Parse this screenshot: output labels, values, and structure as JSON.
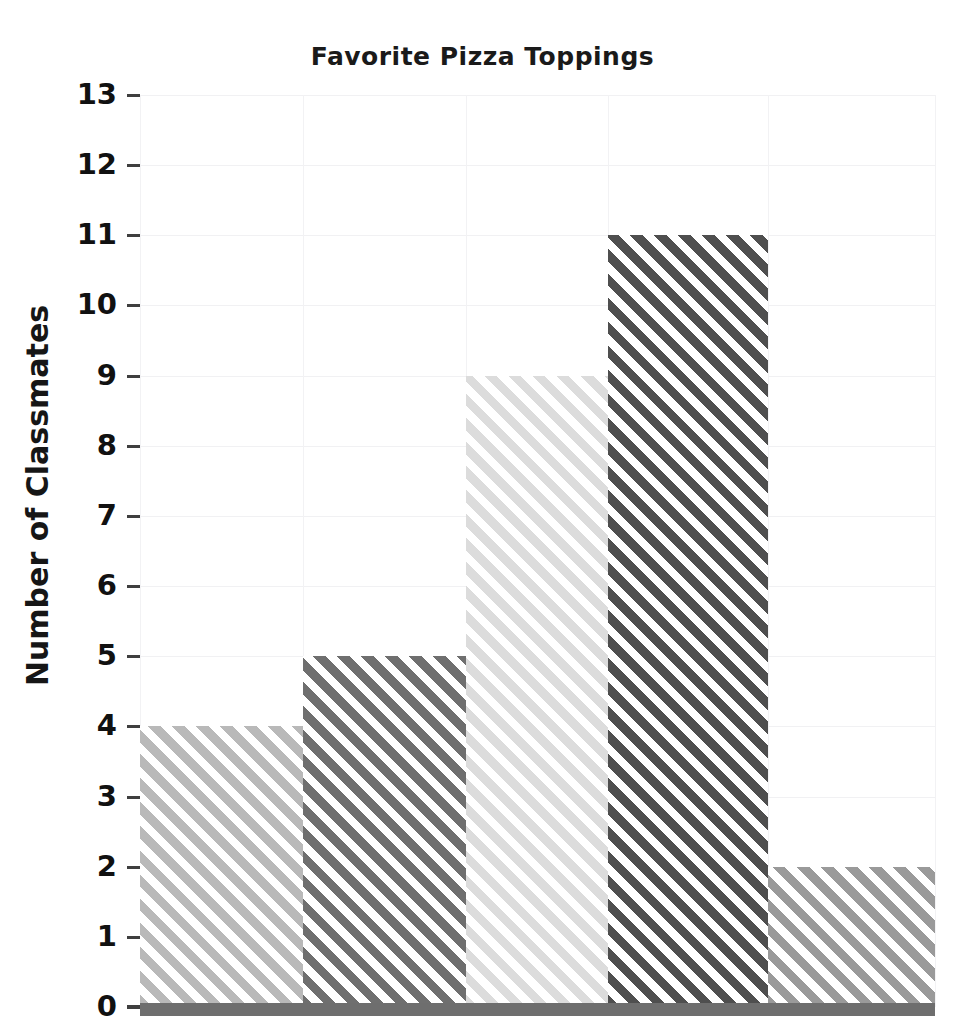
{
  "chart_data": {
    "type": "bar",
    "title": "Favorite Pizza Toppings",
    "xlabel": "",
    "ylabel": "Number of Classmates",
    "categories": [
      "bar-1",
      "bar-2",
      "bar-3",
      "bar-4",
      "bar-5"
    ],
    "values": [
      4,
      5,
      9,
      11,
      2
    ],
    "ylim": [
      0,
      13
    ],
    "yticks": [
      0,
      1,
      2,
      3,
      4,
      5,
      6,
      7,
      8,
      9,
      10,
      11,
      12,
      13
    ],
    "ytick_labels": [
      "0",
      "1",
      "2",
      "3",
      "4",
      "5",
      "6",
      "7",
      "8",
      "9",
      "10",
      "11",
      "12",
      "13"
    ],
    "grid": true,
    "legend": "none",
    "bar_colors": [
      "#b9b9b9",
      "#6f6f6f",
      "#dcdcdc",
      "#4f4f4f",
      "#9a9a9a"
    ],
    "bar_hatch": "diagonal-lines",
    "axis_color": "#6e6e6e",
    "grid_color": "#f1f1f3",
    "background": "#ffffff",
    "bar_edges": [
      0,
      163,
      326,
      468,
      628,
      795
    ]
  }
}
